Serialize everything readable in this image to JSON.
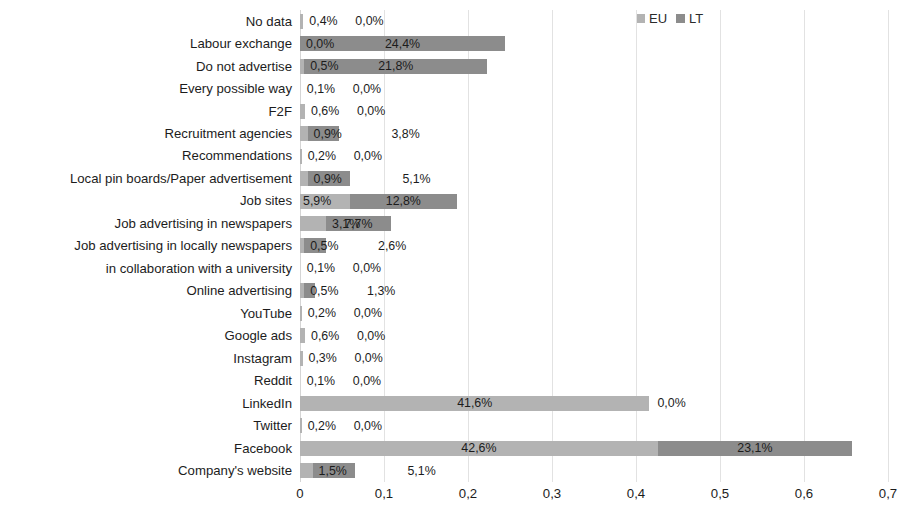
{
  "chart_data": {
    "type": "bar",
    "orientation": "horizontal",
    "stacked": true,
    "title": "",
    "xlabel": "",
    "ylabel": "",
    "xlim": [
      0,
      0.7
    ],
    "grid": true,
    "legend_position": "top-right",
    "xticks": [
      "0",
      "0,1",
      "0,2",
      "0,3",
      "0,4",
      "0,5",
      "0,6",
      "0,7"
    ],
    "xtick_values": [
      0,
      0.1,
      0.2,
      0.3,
      0.4,
      0.5,
      0.6,
      0.7
    ],
    "categories": [
      "No data",
      "Labour exchange",
      "Do not advertise",
      "Every possible way",
      "F2F",
      "Recruitment agencies",
      "Recommendations",
      "Local pin boards/Paper advertisement",
      "Job sites",
      "Job advertising in newspapers",
      "Job advertising in locally newspapers",
      "in collaboration with a university",
      "Online advertising",
      "YouTube",
      "Google ads",
      "Instagram",
      "Reddit",
      "LinkedIn",
      "Twitter",
      "Facebook",
      "Company's website"
    ],
    "series": [
      {
        "name": "EU",
        "color": "#b3b3b3",
        "values": [
          0.004,
          0.0,
          0.005,
          0.001,
          0.006,
          0.009,
          0.002,
          0.009,
          0.059,
          0.031,
          0.005,
          0.001,
          0.005,
          0.002,
          0.006,
          0.003,
          0.001,
          0.416,
          0.002,
          0.426,
          0.015
        ],
        "labels": [
          "0,4%",
          "0,0%",
          "0,5%",
          "0,1%",
          "0,6%",
          "0,9%",
          "0,2%",
          "0,9%",
          "5,9%",
          "3,1%",
          "0,5%",
          "0,1%",
          "0,5%",
          "0,2%",
          "0,6%",
          "0,3%",
          "0,1%",
          "41,6%",
          "0,2%",
          "42,6%",
          "1,5%"
        ]
      },
      {
        "name": "LT",
        "color": "#8c8c8c",
        "values": [
          0.0,
          0.244,
          0.218,
          0.0,
          0.0,
          0.038,
          0.0,
          0.051,
          0.128,
          0.077,
          0.026,
          0.0,
          0.013,
          0.0,
          0.0,
          0.0,
          0.0,
          0.0,
          0.0,
          0.231,
          0.051
        ],
        "labels": [
          "0,0%",
          "24,4%",
          "21,8%",
          "0,0%",
          "0,0%",
          "3,8%",
          "0,0%",
          "5,1%",
          "12,8%",
          "7,7%",
          "2,6%",
          "0,0%",
          "1,3%",
          "0,0%",
          "0,0%",
          "0,0%",
          "0,0%",
          "0,0%",
          "0,0%",
          "23,1%",
          "5,1%"
        ]
      }
    ]
  }
}
